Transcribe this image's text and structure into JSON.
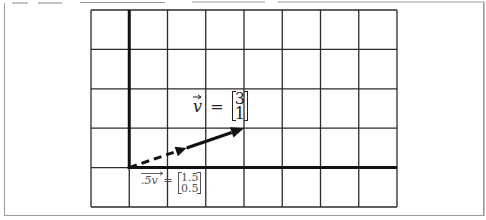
{
  "diagram": {
    "type": "vector-scaling-grid",
    "grid": {
      "columns": 8,
      "rows": 5,
      "left": 91,
      "top": 10,
      "right": 397,
      "bottom": 207,
      "line_color": "#2b2b2b",
      "axis_color": "#111111"
    },
    "axes": {
      "origin_column": 1,
      "origin_row_from_top": 4
    },
    "vectors": [
      {
        "name": "v",
        "components": [
          3,
          1
        ],
        "style": "solid",
        "label_symbol": "v",
        "label_equals": "=",
        "label_top": "3",
        "label_bottom": "1"
      },
      {
        "name": ".5v",
        "components": [
          1.5,
          0.5
        ],
        "style": "dashed",
        "label_symbol": ".5v",
        "label_equals": "=",
        "label_top": "1.5",
        "label_bottom": "0.5"
      }
    ]
  }
}
